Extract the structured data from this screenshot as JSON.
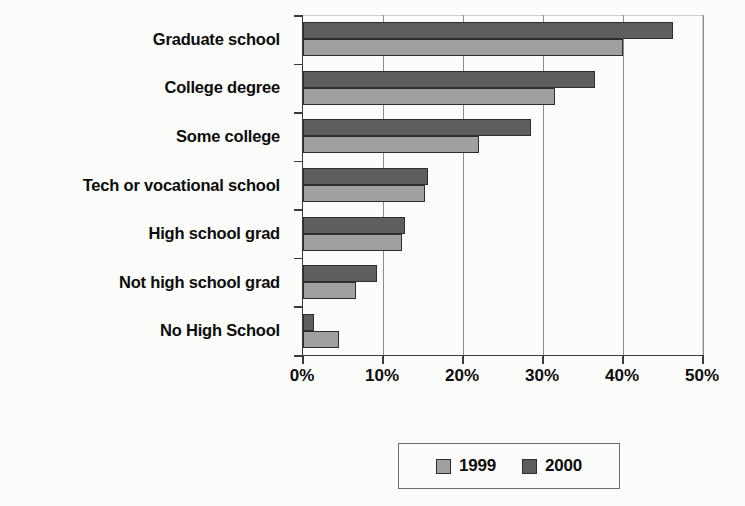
{
  "chart_data": {
    "type": "bar",
    "orientation": "horizontal",
    "title": "",
    "subtitle": "",
    "xlabel": "",
    "ylabel": "",
    "xlim": [
      0,
      50
    ],
    "xticks": [
      0,
      10,
      20,
      30,
      40,
      50
    ],
    "xtick_labels": [
      "0%",
      "10%",
      "20%",
      "30%",
      "40%",
      "50%"
    ],
    "grid": true,
    "grid_axis": "x",
    "legend_position": "bottom",
    "categories": [
      "Graduate school",
      "College degree",
      "Some college",
      "Tech or vocational school",
      "High school grad",
      "Not high school grad",
      "No High School"
    ],
    "series": [
      {
        "name": "1999",
        "color": "#a0a0a0",
        "values": [
          40.0,
          31.5,
          22.0,
          15.3,
          12.4,
          6.6,
          4.5
        ]
      },
      {
        "name": "2000",
        "color": "#5e5e5e",
        "values": [
          46.3,
          36.5,
          28.5,
          15.6,
          12.8,
          9.3,
          1.4
        ]
      }
    ]
  },
  "legend": {
    "entries": [
      {
        "label": "1999",
        "swatch_name": "legend-swatch-1999"
      },
      {
        "label": "2000",
        "swatch_name": "legend-swatch-2000"
      }
    ]
  },
  "colors": {
    "series_1999": "#a0a0a0",
    "series_2000": "#5e5e5e",
    "axis": "#3b3b3b",
    "gridline": "#8c8c8c",
    "background": "#fcfcfa",
    "text": "#0c0c0c"
  }
}
